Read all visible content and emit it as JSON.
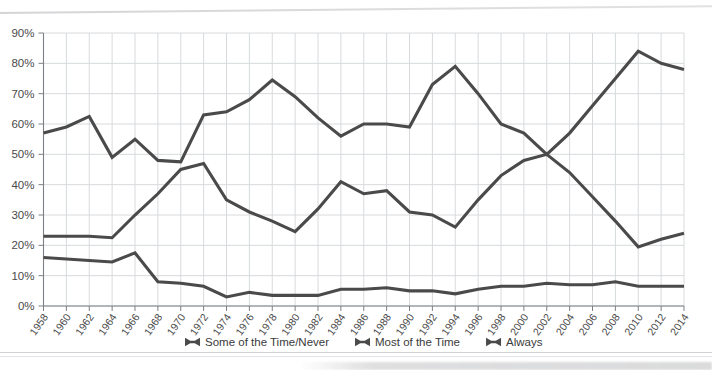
{
  "chart_data": {
    "type": "line",
    "title": "",
    "subtitle": "",
    "xlabel": "",
    "ylabel": "",
    "ylim": [
      0,
      90
    ],
    "ytick_step": 10,
    "grid": true,
    "legend_position": "bottom",
    "ytick_labels": [
      "0%",
      "10%",
      "20%",
      "30%",
      "40%",
      "50%",
      "60%",
      "70%",
      "80%",
      "90%"
    ],
    "categories": [
      "1958",
      "1960",
      "1962",
      "1964",
      "1966",
      "1968",
      "1970",
      "1972",
      "1974",
      "1976",
      "1978",
      "1980",
      "1982",
      "1984",
      "1986",
      "1988",
      "1990",
      "1992",
      "1994",
      "1996",
      "1998",
      "2000",
      "2002",
      "2004",
      "2006",
      "2008",
      "2010",
      "2012",
      "2014"
    ],
    "series": [
      {
        "name": "Some of the Time/Never",
        "color": "#4a4a4a",
        "marker": "bowtie",
        "values": [
          23,
          23,
          23,
          22.5,
          30,
          37,
          45,
          47,
          35,
          31,
          28,
          24.5,
          32,
          41,
          37,
          38,
          31,
          30,
          26,
          35,
          43,
          48,
          50,
          44,
          36,
          28,
          19.5,
          22,
          24
        ]
      },
      {
        "name": "Most of the Time",
        "color": "#4a4a4a",
        "marker": "bowtie",
        "values": [
          57,
          59,
          62.5,
          49,
          55,
          48,
          47.5,
          63,
          64,
          68,
          74.5,
          69,
          62,
          56,
          60,
          60,
          59,
          73,
          79,
          70,
          60,
          57,
          50,
          57,
          66,
          75,
          84,
          80,
          78
        ]
      },
      {
        "name": "Always",
        "color": "#4a4a4a",
        "marker": "bowtie",
        "values": [
          16,
          15.5,
          15,
          14.5,
          17.5,
          8,
          7.5,
          6.5,
          3,
          4.5,
          3.5,
          3.5,
          3.5,
          5.5,
          5.5,
          6,
          5,
          5,
          4,
          5.5,
          6.5,
          6.5,
          7.5,
          7,
          7,
          8,
          6.5,
          6.5,
          6.5
        ]
      }
    ],
    "legend": [
      {
        "label": "Some of the Time/Never",
        "marker": "bowtie-marker"
      },
      {
        "label": "Most of the Time",
        "marker": "bowtie-marker"
      },
      {
        "label": "Always",
        "marker": "bowtie-marker"
      }
    ]
  }
}
